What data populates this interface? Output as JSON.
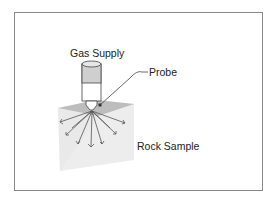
{
  "diagram": {
    "labels": {
      "gas_supply": "Gas Supply",
      "probe": "Probe",
      "rock_sample": "Rock Sample"
    },
    "colors": {
      "frame": "#8a8a8a",
      "cylinder_top": "#d0d0d0",
      "cylinder_body": "#ffffff",
      "rock_top": "#b8b8b8",
      "rock_face": "#ececec",
      "arrows": "#555555"
    }
  }
}
